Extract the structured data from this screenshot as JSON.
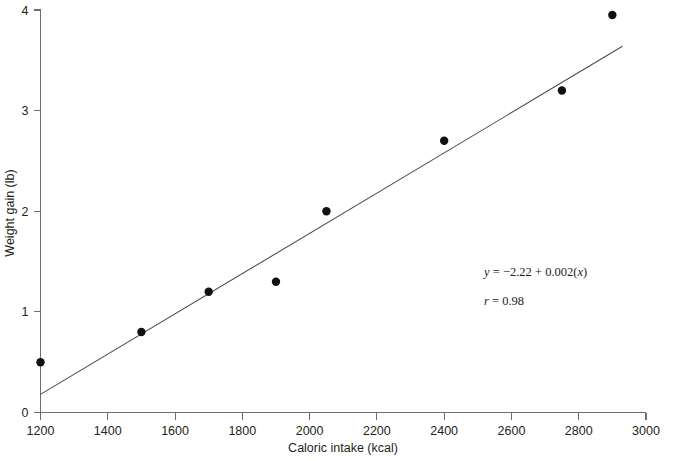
{
  "chart_data": {
    "type": "scatter",
    "title": "",
    "xlabel": "Caloric intake (kcal)",
    "ylabel": "Weight gain (lb)",
    "xlim": [
      1200,
      3000
    ],
    "ylim": [
      0,
      4
    ],
    "xticks": [
      1200,
      1400,
      1600,
      1800,
      2000,
      2200,
      2400,
      2600,
      2800,
      3000
    ],
    "yticks": [
      0,
      1,
      2,
      3,
      4
    ],
    "xtick_labels": [
      "1200",
      "1400",
      "1600",
      "1800",
      "2000",
      "2200",
      "2400",
      "2600",
      "2800",
      "3000"
    ],
    "ytick_labels": [
      "0",
      "1",
      "2",
      "3",
      "4"
    ],
    "grid": false,
    "legend": false,
    "x": [
      1200,
      1500,
      1700,
      1900,
      2050,
      2400,
      2750,
      2900
    ],
    "y": [
      0.5,
      0.8,
      1.2,
      1.3,
      2.0,
      2.7,
      3.2,
      3.95
    ],
    "points": [
      {
        "x": 1200,
        "y": 0.5
      },
      {
        "x": 1500,
        "y": 0.8
      },
      {
        "x": 1700,
        "y": 1.2
      },
      {
        "x": 1900,
        "y": 1.3
      },
      {
        "x": 2050,
        "y": 2.0
      },
      {
        "x": 2400,
        "y": 2.7
      },
      {
        "x": 2750,
        "y": 3.2
      },
      {
        "x": 2900,
        "y": 3.95
      }
    ],
    "fit_line": {
      "intercept": -2.22,
      "slope": 0.002,
      "x_start": 1200,
      "x_end": 2930,
      "y_start": 0.18,
      "y_end": 3.64
    },
    "annotations": {
      "equation": "y = −2.22 + 0.002(x)",
      "equation_parts": {
        "y": "y",
        "eq": " = ",
        "intercept": "−2.22",
        "plus": " + ",
        "slope": "0.002(",
        "x": "x",
        "close": ")"
      },
      "correlation": "r = 0.98",
      "correlation_parts": {
        "r": "r",
        "value": " = 0.98"
      }
    },
    "point_color": "#111111",
    "line_color": "#4a4a4a",
    "axis_color": "#6d6e71"
  }
}
